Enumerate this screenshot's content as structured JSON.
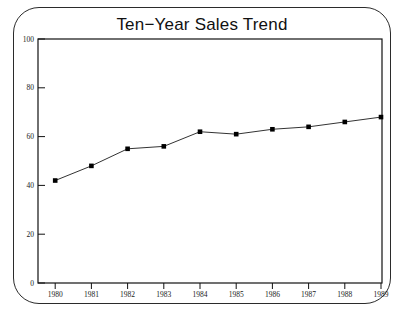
{
  "chart_data": {
    "type": "line",
    "title": "Ten−Year Sales Trend",
    "xlabel": "",
    "ylabel": "",
    "categories": [
      "1980",
      "1981",
      "1982",
      "1983",
      "1984",
      "1985",
      "1986",
      "1987",
      "1988",
      "1989"
    ],
    "values": [
      42,
      48,
      55,
      56,
      62,
      61,
      63,
      64,
      66,
      68
    ],
    "series": [
      {
        "name": "Sales",
        "values": [
          42,
          48,
          55,
          56,
          62,
          61,
          63,
          64,
          66,
          68
        ]
      }
    ],
    "ylim": [
      0,
      100
    ],
    "yticks": [
      0,
      20,
      40,
      60,
      80,
      100
    ],
    "ytick_labels": [
      "0",
      "20",
      "40",
      "60",
      "80",
      "100"
    ],
    "xticks": [
      "1980",
      "1981",
      "1982",
      "1983",
      "1984",
      "1985",
      "1986",
      "1987",
      "1988",
      "1989"
    ],
    "grid": false,
    "legend": null,
    "legend_position": "none",
    "marker": "filled-square",
    "line_color": "#333333",
    "marker_color": "#000000",
    "axis_color": "#111111",
    "background_color": "#ffffff",
    "border_color": "#2b2b2b",
    "annotations": []
  },
  "labels": {
    "y_0": "0",
    "y_20": "20",
    "y_40": "40",
    "y_60": "60",
    "y_80": "80",
    "y_100": "100",
    "x_1980": "1980",
    "x_1981": "1981",
    "x_1982": "1982",
    "x_1983": "1983",
    "x_1984": "1984",
    "x_1985": "1985",
    "x_1986": "1986",
    "x_1987": "1987",
    "x_1988": "1988",
    "x_1989": "1989"
  }
}
